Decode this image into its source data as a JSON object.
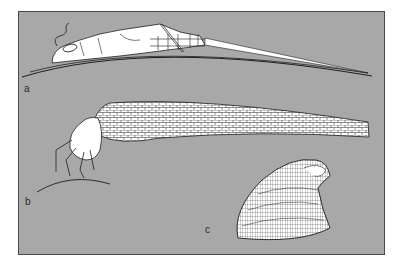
{
  "figure": {
    "background_color": "#a8a8a8",
    "border_color": "#4a4a4a",
    "line_color": "#1e1e1e",
    "fill_color": "#ffffff",
    "panels": [
      {
        "label": "a",
        "subject": "flattened-nymph-on-stone"
      },
      {
        "label": "b",
        "subject": "larva-with-stone-case"
      },
      {
        "label": "c",
        "subject": "limpet-like-shell"
      }
    ]
  }
}
